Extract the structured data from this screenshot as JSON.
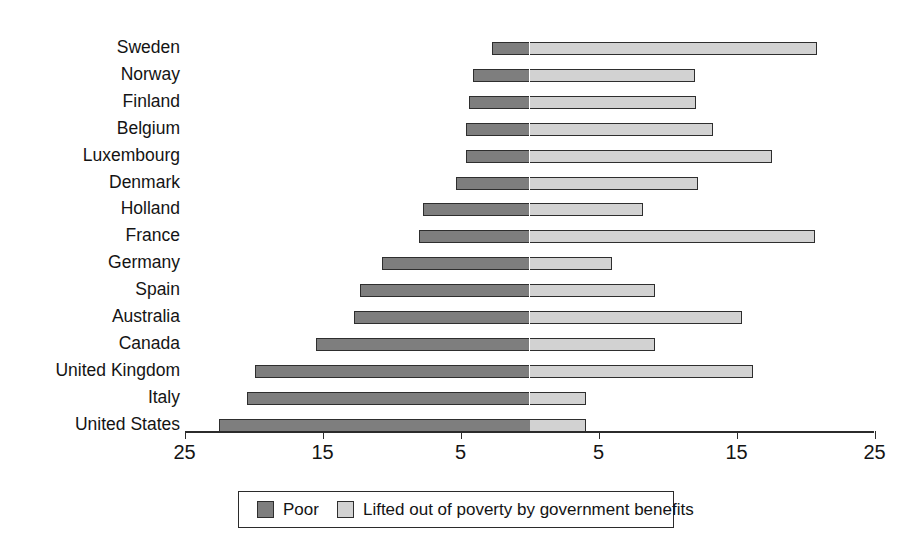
{
  "chart_data": {
    "type": "bar",
    "orientation": "horizontal",
    "layout": "diverging-stacked",
    "title": "",
    "subtitle": "",
    "xlabel": "",
    "ylabel": "",
    "grid": false,
    "legend_position": "bottom",
    "axis": {
      "zero_center": true,
      "tick_labels": [
        "25",
        "15",
        "5",
        "5",
        "15",
        "25"
      ],
      "tick_values": [
        -25,
        -15,
        -5,
        5,
        15,
        25
      ],
      "left_range": [
        25,
        0
      ],
      "right_range": [
        0,
        25
      ]
    },
    "categories": [
      "Sweden",
      "Norway",
      "Finland",
      "Belgium",
      "Luxembourg",
      "Denmark",
      "Holland",
      "France",
      "Germany",
      "Spain",
      "Australia",
      "Canada",
      "United Kingdom",
      "Italy",
      "United States"
    ],
    "series": [
      {
        "name": "Poor",
        "direction": "left",
        "color": "#7e7e7e",
        "values": [
          2.7,
          4.1,
          4.4,
          4.6,
          4.6,
          5.3,
          7.7,
          8.0,
          10.7,
          12.3,
          12.7,
          15.5,
          19.9,
          20.5,
          22.5
        ]
      },
      {
        "name": "Lifted out of poverty by government benefits",
        "direction": "right",
        "color": "#d2d2d2",
        "values": [
          20.8,
          12.0,
          12.1,
          13.3,
          17.6,
          12.2,
          8.2,
          20.7,
          6.0,
          9.1,
          15.4,
          9.1,
          16.2,
          4.1,
          4.1
        ]
      }
    ]
  },
  "legend": {
    "items": [
      {
        "label": "Poor",
        "swatch": "poor"
      },
      {
        "label": "Lifted out of poverty by government benefits",
        "swatch": "lifted"
      }
    ]
  },
  "colors": {
    "poor": "#7e7e7e",
    "lifted": "#d2d2d2",
    "outline": "#2e2e2e",
    "background": "#ffffff",
    "text": "#141414"
  }
}
